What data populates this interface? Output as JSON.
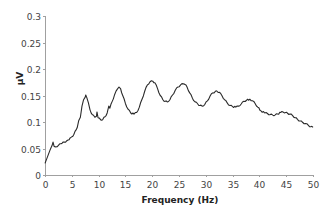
{
  "chart_data": {
    "type": "line",
    "title": "",
    "xlabel": "Frequency (Hz)",
    "ylabel": "μV",
    "xlim": [
      0,
      50
    ],
    "ylim": [
      0,
      0.3
    ],
    "grid": false,
    "legend": "none",
    "xticks": [
      0,
      5,
      10,
      15,
      20,
      25,
      30,
      35,
      40,
      45,
      50
    ],
    "xtick_labels": [
      "0",
      "5",
      "10",
      "15",
      "20",
      "25",
      "30",
      "35",
      "40",
      "45",
      "50"
    ],
    "yticks": [
      0,
      0.05,
      0.1,
      0.15,
      0.2,
      0.25,
      0.3
    ],
    "ytick_labels": [
      "0",
      "0.05",
      "0.1",
      "0.15",
      "0.2",
      "0.25",
      "0.3"
    ],
    "series": [
      {
        "name": "spectrum",
        "color": "#2a2a2a",
        "x": [
          0,
          0.3,
          0.6,
          0.9,
          1.1,
          1.3,
          1.5,
          1.7,
          2.0,
          2.5,
          3.0,
          3.2,
          3.6,
          4.0,
          4.3,
          4.7,
          5.0,
          5.4,
          5.8,
          6.0,
          6.3,
          6.6,
          6.9,
          7.2,
          7.5,
          7.6,
          7.8,
          8.1,
          8.4,
          8.8,
          9.3,
          9.6,
          9.7,
          9.9,
          10.4,
          10.8,
          11.2,
          11.6,
          11.9,
          12.1,
          12.5,
          13.0,
          13.5,
          13.8,
          14.1,
          14.5,
          15.0,
          15.5,
          16.0,
          16.6,
          17.1,
          17.6,
          18.1,
          18.6,
          19.1,
          19.6,
          20.1,
          20.5,
          21.0,
          21.5,
          22.0,
          22.4,
          22.8,
          23.3,
          23.8,
          24.3,
          24.8,
          25.3,
          25.8,
          26.1,
          26.5,
          27.0,
          27.5,
          28.0,
          28.5,
          28.9,
          29.3,
          29.8,
          30.3,
          30.8,
          31.3,
          31.7,
          32.1,
          32.5,
          33.0,
          33.5,
          34.0,
          34.5,
          35.0,
          35.6,
          36.1,
          36.6,
          37.1,
          37.6,
          38.2,
          38.7,
          39.2,
          39.7,
          40.3,
          41.0,
          41.5,
          42.0,
          42.5,
          42.9,
          43.4,
          44.0,
          44.4,
          44.9,
          45.3,
          45.7,
          46.2,
          46.7,
          47.1,
          47.6,
          48.1,
          48.6,
          49.1,
          49.6,
          50.0
        ],
        "y": [
          0.022,
          0.03,
          0.038,
          0.046,
          0.051,
          0.055,
          0.062,
          0.054,
          0.053,
          0.056,
          0.059,
          0.06,
          0.062,
          0.064,
          0.066,
          0.07,
          0.072,
          0.077,
          0.085,
          0.089,
          0.103,
          0.109,
          0.13,
          0.142,
          0.147,
          0.151,
          0.146,
          0.136,
          0.123,
          0.114,
          0.109,
          0.111,
          0.119,
          0.108,
          0.104,
          0.105,
          0.11,
          0.117,
          0.13,
          0.126,
          0.138,
          0.152,
          0.162,
          0.166,
          0.163,
          0.15,
          0.135,
          0.124,
          0.117,
          0.115,
          0.118,
          0.128,
          0.143,
          0.158,
          0.17,
          0.176,
          0.177,
          0.174,
          0.163,
          0.15,
          0.142,
          0.139,
          0.138,
          0.142,
          0.151,
          0.16,
          0.166,
          0.17,
          0.172,
          0.171,
          0.166,
          0.155,
          0.145,
          0.138,
          0.134,
          0.131,
          0.13,
          0.133,
          0.14,
          0.149,
          0.155,
          0.157,
          0.158,
          0.156,
          0.15,
          0.142,
          0.136,
          0.131,
          0.129,
          0.128,
          0.13,
          0.134,
          0.139,
          0.141,
          0.143,
          0.14,
          0.135,
          0.128,
          0.121,
          0.117,
          0.116,
          0.114,
          0.113,
          0.113,
          0.115,
          0.118,
          0.119,
          0.118,
          0.116,
          0.115,
          0.112,
          0.108,
          0.105,
          0.102,
          0.099,
          0.097,
          0.094,
          0.091,
          0.09
        ]
      }
    ]
  }
}
